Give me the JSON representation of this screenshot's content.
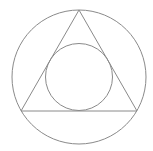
{
  "diagram": {
    "stroke_color": "#8a8a8a",
    "background": "#ffffff",
    "outer_circle": {
      "cx": 79,
      "cy": 77,
      "r": 67
    },
    "triangle": {
      "points": "79,10 21,111 137,111"
    },
    "inner_circle": {
      "cx": 79,
      "cy": 77,
      "r": 33.5
    }
  }
}
